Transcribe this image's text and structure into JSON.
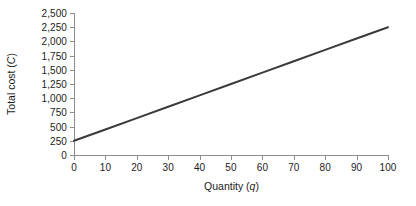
{
  "chart_data": {
    "type": "line",
    "title": "",
    "xlabel": "Quantity (q)",
    "xlabel_text": "Quantity (",
    "xlabel_var": "q",
    "xlabel_tail": ")",
    "ylabel": "Total cost (C)",
    "ylabel_text": "Total cost (",
    "ylabel_var": "C",
    "ylabel_tail": ")",
    "xlim": [
      0,
      100
    ],
    "ylim": [
      0,
      2500
    ],
    "grid": false,
    "legend": false,
    "legend_position": "none",
    "x_ticks": [
      0,
      10,
      20,
      30,
      40,
      50,
      60,
      70,
      80,
      90,
      100
    ],
    "x_tick_labels": [
      "0",
      "10",
      "20",
      "30",
      "40",
      "50",
      "60",
      "70",
      "80",
      "90",
      "100"
    ],
    "y_ticks": [
      0,
      250,
      500,
      750,
      1000,
      1250,
      1500,
      1750,
      2000,
      2250,
      2500
    ],
    "y_tick_labels": [
      "0",
      "250",
      "500",
      "750",
      "1,000",
      "1,250",
      "1,500",
      "1,750",
      "2,000",
      "2,250",
      "2,500"
    ],
    "series": [
      {
        "name": "Total cost",
        "color": "#3a3a3a",
        "linewidth": 2,
        "equation": "C = 250 + 20q",
        "intercept": 250,
        "slope": 20,
        "x": [
          0,
          10,
          20,
          30,
          40,
          50,
          60,
          70,
          80,
          90,
          100
        ],
        "values": [
          250,
          450,
          650,
          850,
          1050,
          1250,
          1450,
          1650,
          1850,
          2050,
          2250
        ]
      }
    ]
  },
  "style": {
    "axis_color": "#8d8d8d",
    "text_color": "#1b1b1b",
    "line_color": "#3a3a3a",
    "background": "#ffffff"
  }
}
